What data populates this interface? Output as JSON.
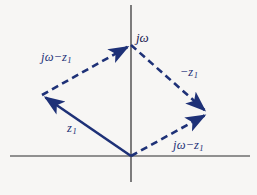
{
  "figure": {
    "background_color": "#f7f6f4",
    "vector_color": "#1e3177",
    "axis_color": "#2b2b2b",
    "width": 257,
    "height": 195
  },
  "axes": {
    "vertical_label": "jω",
    "origin": {
      "x": 131,
      "y": 156
    },
    "horizontal": {
      "x1": 10,
      "y1": 156,
      "x2": 250,
      "y2": 156
    },
    "vertical": {
      "x1": 131,
      "y1": 5,
      "x2": 131,
      "y2": 182
    }
  },
  "labels": {
    "jw_minus_z1_upper": {
      "pre": "jω",
      "op": "−",
      "sym": "z",
      "sub": "1"
    },
    "minus_z1": {
      "pre": "",
      "op": "−",
      "sym": "z",
      "sub": "1"
    },
    "z1": {
      "pre": "",
      "op": "",
      "sym": "z",
      "sub": "1"
    },
    "jw_minus_z1_lower": {
      "pre": "jω",
      "op": "−",
      "sym": "z",
      "sub": "1"
    }
  },
  "vectors": [
    {
      "name": "z1",
      "style": "solid",
      "from": {
        "x": 131,
        "y": 156
      },
      "to": {
        "x": 42,
        "y": 95
      },
      "label": "z₁",
      "arrowhead": "end"
    },
    {
      "name": "jw-minus-z1-upper",
      "style": "dashed",
      "from": {
        "x": 42,
        "y": 95
      },
      "to": {
        "x": 131,
        "y": 45
      },
      "label": "jω − z₁",
      "arrowhead": "end"
    },
    {
      "name": "minus-z1",
      "style": "dashed",
      "from": {
        "x": 131,
        "y": 45
      },
      "to": {
        "x": 208,
        "y": 113
      },
      "label": "−z₁",
      "arrowhead": "end"
    },
    {
      "name": "jw-minus-z1-lower",
      "style": "dashed",
      "from": {
        "x": 131,
        "y": 156
      },
      "to": {
        "x": 208,
        "y": 113
      },
      "label": "jω − z₁",
      "arrowhead": "end"
    }
  ]
}
